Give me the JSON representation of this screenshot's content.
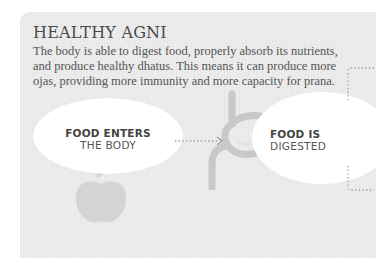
{
  "section": {
    "title": "HEALTHY AGNI",
    "description_lines": [
      "The body is able to digest food, properly absorb its nutrients,",
      "and produce healthy dhatus. This means it can produce more",
      "ojas, providing more immunity and more capacity for prana."
    ]
  },
  "steps": [
    {
      "title": "FOOD ENTERS",
      "subtitle": "THE BODY",
      "icon": "apple-icon"
    },
    {
      "title": "FOOD IS",
      "subtitle": "DIGESTED",
      "icon": "stomach-icon"
    }
  ],
  "colors": {
    "panel": "#ececec",
    "lens": "#ffffff",
    "icon": "#c9c9c9",
    "dots": "#9a9a9a",
    "text": "#4a4a4a"
  }
}
